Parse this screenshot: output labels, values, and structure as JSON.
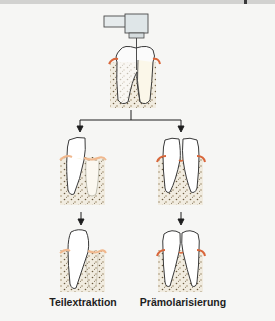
{
  "diagram": {
    "type": "dental-procedure-flowchart",
    "top": {
      "description": "Lower molar with drill (handpiece) sectioning the crown between the two roots",
      "elements": [
        "handpiece",
        "bur",
        "molar-crown",
        "mesial-root",
        "distal-root (yellow-tinted)",
        "gingiva",
        "alveolar-bone"
      ]
    },
    "branches": [
      {
        "id": "left",
        "label": "Teilextraktion",
        "step1": "Sectioned molar with one root removed (extraction socket)",
        "step2": "Remaining half-molar, socket healed"
      },
      {
        "id": "right",
        "label": "Prämolarisierung",
        "step1": "Sectioned molar, both halves retained",
        "step2": "Two premolar-like crowns on separate roots"
      }
    ],
    "colors": {
      "background": "#f6f6f4",
      "outline": "#3a3a3a",
      "gingiva": "#d9663a",
      "gingiva_light": "#f0b88e",
      "bone": "#f1ece0",
      "bone_dots": "#7a6a4a",
      "root_tint": "#f5ecc8",
      "handpiece": "#e3e8ea",
      "arrow": "#1e1e1e"
    }
  },
  "labels": {
    "left": "Teilextraktion",
    "right": "Prämolarisierung"
  }
}
